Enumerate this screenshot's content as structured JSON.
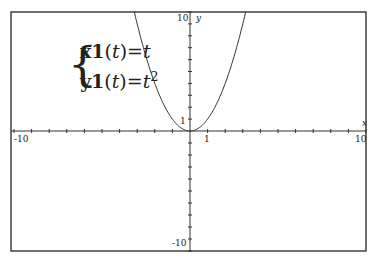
{
  "chart_data": {
    "type": "line",
    "title": "",
    "xlabel": "x",
    "ylabel": "y",
    "xlim": [
      -10,
      10
    ],
    "ylim": [
      -10,
      10
    ],
    "x_tick_labels": [
      "-10",
      "1",
      "10"
    ],
    "y_tick_labels": [
      "10",
      "1",
      "-10"
    ],
    "grid": false,
    "legend": null,
    "series": [
      {
        "name": "x1(t)=t, y1(t)=t^2",
        "parametric": {
          "x": "t",
          "y": "t^2"
        },
        "x": [
          -3.2,
          -3,
          -2.5,
          -2,
          -1.5,
          -1,
          -0.5,
          0,
          0.5,
          1,
          1.5,
          2,
          2.5,
          3,
          3.2
        ],
        "values": [
          10.24,
          9,
          6.25,
          4,
          2.25,
          1,
          0.25,
          0,
          0.25,
          1,
          2.25,
          4,
          6.25,
          9,
          10.24
        ]
      }
    ],
    "annotations": [
      "x1(t)=t",
      "y1(t)=t^2"
    ]
  },
  "equations": {
    "line1_name": "x1",
    "line1_arg": "t",
    "line1_rhs": "t",
    "line2_name": "y1",
    "line2_arg": "t",
    "line2_rhs": "t",
    "line2_exp": "2"
  },
  "axes": {
    "x_label": "x",
    "y_label": "y",
    "x_min_label": "-10",
    "x_max_label": "10",
    "x_one_label": "1",
    "y_max_label": "10",
    "y_min_label": "-10",
    "y_one_label": "1"
  },
  "colors": {
    "axis": "#333333",
    "curve": "#333333",
    "frame": "#222222"
  }
}
